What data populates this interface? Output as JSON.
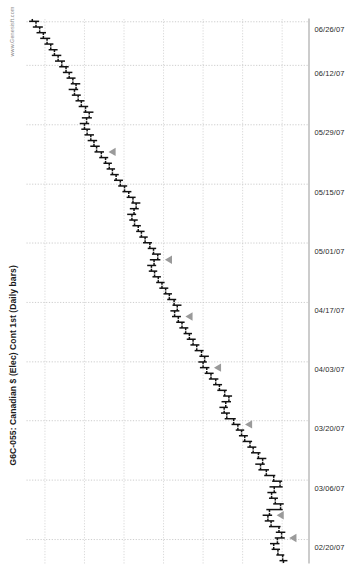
{
  "chart": {
    "title": "G6C-055: Canadian $ (Elec) Cont 1st (Daily bars)",
    "watermark": "www.Genesisft.com"
  },
  "chart_data": {
    "type": "ohlc",
    "title": "G6C-055: Canadian $ (Elec) Cont 1st (Daily bars)",
    "subtitle": "",
    "xlabel": "",
    "ylabel": "",
    "grid": true,
    "legend": false,
    "orientation": "rotated-90-ccw",
    "bar_style": "open-left-tick / close-right-tick OHLC daily bars",
    "bar_color": "#111111",
    "marker_color": "#9a9a9a",
    "marker_shape": "triangle",
    "marker_note": "gray triangle markers placed beside selected bars",
    "xlim": [
      "02/13/07",
      "06/29/07"
    ],
    "ylim": [
      0.845,
      0.952
    ],
    "ytick_step": 0.015,
    "xtick_labels": [
      "02/20/07",
      "03/06/07",
      "03/20/07",
      "04/03/07",
      "04/17/07",
      "05/01/07",
      "05/15/07",
      "05/29/07",
      "06/12/07",
      "06/26/07"
    ],
    "xtick_positions_pct": [
      4.4,
      15.3,
      26.2,
      37.0,
      47.9,
      58.8,
      69.6,
      80.5,
      91.4,
      99.4
    ],
    "ygridlines": [
      0.855,
      0.87,
      0.885,
      0.9,
      0.915,
      0.93,
      0.945
    ],
    "bars": [
      {
        "date": "02/13/07",
        "open": 0.8545,
        "high": 0.856,
        "low": 0.853,
        "close": 0.8548,
        "marker": false
      },
      {
        "date": "02/14/07",
        "open": 0.8548,
        "high": 0.8572,
        "low": 0.8542,
        "close": 0.8566,
        "marker": false
      },
      {
        "date": "02/15/07",
        "open": 0.8566,
        "high": 0.859,
        "low": 0.8558,
        "close": 0.8582,
        "marker": false
      },
      {
        "date": "02/16/07",
        "open": 0.8582,
        "high": 0.8596,
        "low": 0.856,
        "close": 0.8568,
        "marker": false
      },
      {
        "date": "02/20/07",
        "open": 0.8568,
        "high": 0.8578,
        "low": 0.854,
        "close": 0.8552,
        "marker": true
      },
      {
        "date": "02/21/07",
        "open": 0.8552,
        "high": 0.8574,
        "low": 0.8538,
        "close": 0.8562,
        "marker": false
      },
      {
        "date": "02/22/07",
        "open": 0.8562,
        "high": 0.86,
        "low": 0.8556,
        "close": 0.8592,
        "marker": false
      },
      {
        "date": "02/23/07",
        "open": 0.8592,
        "high": 0.8616,
        "low": 0.858,
        "close": 0.8604,
        "marker": false
      },
      {
        "date": "02/26/07",
        "open": 0.8604,
        "high": 0.8624,
        "low": 0.8588,
        "close": 0.8598,
        "marker": true
      },
      {
        "date": "02/27/07",
        "open": 0.8598,
        "high": 0.861,
        "low": 0.8548,
        "close": 0.8556,
        "marker": false
      },
      {
        "date": "02/28/07",
        "open": 0.8556,
        "high": 0.8584,
        "low": 0.8544,
        "close": 0.8576,
        "marker": false
      },
      {
        "date": "03/01/07",
        "open": 0.8576,
        "high": 0.86,
        "low": 0.8566,
        "close": 0.859,
        "marker": false
      },
      {
        "date": "03/02/07",
        "open": 0.859,
        "high": 0.8606,
        "low": 0.8572,
        "close": 0.858,
        "marker": false
      },
      {
        "date": "03/05/07",
        "open": 0.858,
        "high": 0.8598,
        "low": 0.8548,
        "close": 0.8558,
        "marker": false
      },
      {
        "date": "03/06/07",
        "open": 0.8558,
        "high": 0.8588,
        "low": 0.855,
        "close": 0.8582,
        "marker": false
      },
      {
        "date": "03/07/07",
        "open": 0.8582,
        "high": 0.8618,
        "low": 0.8576,
        "close": 0.861,
        "marker": false
      },
      {
        "date": "03/08/07",
        "open": 0.861,
        "high": 0.864,
        "low": 0.86,
        "close": 0.8632,
        "marker": false
      },
      {
        "date": "03/09/07",
        "open": 0.8632,
        "high": 0.8652,
        "low": 0.8616,
        "close": 0.8624,
        "marker": false
      },
      {
        "date": "03/12/07",
        "open": 0.8624,
        "high": 0.8646,
        "low": 0.861,
        "close": 0.864,
        "marker": false
      },
      {
        "date": "03/13/07",
        "open": 0.864,
        "high": 0.8668,
        "low": 0.8632,
        "close": 0.866,
        "marker": false
      },
      {
        "date": "03/14/07",
        "open": 0.866,
        "high": 0.8682,
        "low": 0.8648,
        "close": 0.8672,
        "marker": false
      },
      {
        "date": "03/15/07",
        "open": 0.8672,
        "high": 0.87,
        "low": 0.8664,
        "close": 0.8692,
        "marker": false
      },
      {
        "date": "03/16/07",
        "open": 0.8692,
        "high": 0.8714,
        "low": 0.868,
        "close": 0.8704,
        "marker": false
      },
      {
        "date": "03/19/07",
        "open": 0.8704,
        "high": 0.8726,
        "low": 0.8694,
        "close": 0.8718,
        "marker": false
      },
      {
        "date": "03/20/07",
        "open": 0.8718,
        "high": 0.8742,
        "low": 0.8708,
        "close": 0.8734,
        "marker": true
      },
      {
        "date": "03/21/07",
        "open": 0.8734,
        "high": 0.8768,
        "low": 0.8726,
        "close": 0.876,
        "marker": false
      },
      {
        "date": "03/22/07",
        "open": 0.876,
        "high": 0.8782,
        "low": 0.8748,
        "close": 0.877,
        "marker": false
      },
      {
        "date": "03/23/07",
        "open": 0.877,
        "high": 0.8788,
        "low": 0.8756,
        "close": 0.8764,
        "marker": false
      },
      {
        "date": "03/26/07",
        "open": 0.8764,
        "high": 0.878,
        "low": 0.8744,
        "close": 0.8752,
        "marker": false
      },
      {
        "date": "03/27/07",
        "open": 0.8752,
        "high": 0.8774,
        "low": 0.874,
        "close": 0.8768,
        "marker": false
      },
      {
        "date": "03/28/07",
        "open": 0.8768,
        "high": 0.8796,
        "low": 0.876,
        "close": 0.8788,
        "marker": false
      },
      {
        "date": "03/29/07",
        "open": 0.8788,
        "high": 0.8812,
        "low": 0.8778,
        "close": 0.8802,
        "marker": false
      },
      {
        "date": "03/30/07",
        "open": 0.8802,
        "high": 0.8828,
        "low": 0.8792,
        "close": 0.882,
        "marker": false
      },
      {
        "date": "04/02/07",
        "open": 0.882,
        "high": 0.8844,
        "low": 0.881,
        "close": 0.8836,
        "marker": false
      },
      {
        "date": "04/03/07",
        "open": 0.8836,
        "high": 0.8862,
        "low": 0.8826,
        "close": 0.885,
        "marker": true
      },
      {
        "date": "04/04/07",
        "open": 0.885,
        "high": 0.8868,
        "low": 0.8836,
        "close": 0.8844,
        "marker": false
      },
      {
        "date": "04/05/07",
        "open": 0.8844,
        "high": 0.8864,
        "low": 0.8828,
        "close": 0.8856,
        "marker": false
      },
      {
        "date": "04/09/07",
        "open": 0.8856,
        "high": 0.8882,
        "low": 0.8848,
        "close": 0.8874,
        "marker": false
      },
      {
        "date": "04/10/07",
        "open": 0.8874,
        "high": 0.8898,
        "low": 0.8864,
        "close": 0.8888,
        "marker": false
      },
      {
        "date": "04/11/07",
        "open": 0.8888,
        "high": 0.8912,
        "low": 0.8878,
        "close": 0.8902,
        "marker": false
      },
      {
        "date": "04/12/07",
        "open": 0.8902,
        "high": 0.8924,
        "low": 0.8892,
        "close": 0.8916,
        "marker": false
      },
      {
        "date": "04/13/07",
        "open": 0.8916,
        "high": 0.894,
        "low": 0.8906,
        "close": 0.893,
        "marker": false
      },
      {
        "date": "04/16/07",
        "open": 0.893,
        "high": 0.8952,
        "low": 0.892,
        "close": 0.8944,
        "marker": false
      },
      {
        "date": "04/17/07",
        "open": 0.8944,
        "high": 0.8968,
        "low": 0.8934,
        "close": 0.8958,
        "marker": true
      },
      {
        "date": "04/18/07",
        "open": 0.8958,
        "high": 0.8974,
        "low": 0.894,
        "close": 0.8948,
        "marker": false
      },
      {
        "date": "04/19/07",
        "open": 0.8948,
        "high": 0.8966,
        "low": 0.8932,
        "close": 0.896,
        "marker": false
      },
      {
        "date": "04/20/07",
        "open": 0.896,
        "high": 0.8986,
        "low": 0.8952,
        "close": 0.8978,
        "marker": false
      },
      {
        "date": "04/23/07",
        "open": 0.8978,
        "high": 0.9,
        "low": 0.8968,
        "close": 0.8992,
        "marker": false
      },
      {
        "date": "04/24/07",
        "open": 0.8992,
        "high": 0.9016,
        "low": 0.8982,
        "close": 0.9006,
        "marker": false
      },
      {
        "date": "04/25/07",
        "open": 0.9006,
        "high": 0.9028,
        "low": 0.8996,
        "close": 0.902,
        "marker": false
      },
      {
        "date": "04/26/07",
        "open": 0.902,
        "high": 0.9042,
        "low": 0.901,
        "close": 0.9034,
        "marker": false
      },
      {
        "date": "04/27/07",
        "open": 0.9034,
        "high": 0.9056,
        "low": 0.9024,
        "close": 0.9046,
        "marker": false
      },
      {
        "date": "04/30/07",
        "open": 0.9046,
        "high": 0.9062,
        "low": 0.9028,
        "close": 0.9036,
        "marker": false
      },
      {
        "date": "05/01/07",
        "open": 0.9036,
        "high": 0.9052,
        "low": 0.9012,
        "close": 0.9022,
        "marker": true
      },
      {
        "date": "05/02/07",
        "open": 0.9022,
        "high": 0.9044,
        "low": 0.901,
        "close": 0.9038,
        "marker": false
      },
      {
        "date": "05/03/07",
        "open": 0.9038,
        "high": 0.906,
        "low": 0.9028,
        "close": 0.9052,
        "marker": false
      },
      {
        "date": "05/04/07",
        "open": 0.9052,
        "high": 0.9078,
        "low": 0.9044,
        "close": 0.907,
        "marker": false
      },
      {
        "date": "05/07/07",
        "open": 0.907,
        "high": 0.9092,
        "low": 0.906,
        "close": 0.9084,
        "marker": false
      },
      {
        "date": "05/08/07",
        "open": 0.9084,
        "high": 0.9104,
        "low": 0.9072,
        "close": 0.9096,
        "marker": false
      },
      {
        "date": "05/09/07",
        "open": 0.9096,
        "high": 0.9118,
        "low": 0.9086,
        "close": 0.911,
        "marker": false
      },
      {
        "date": "05/10/07",
        "open": 0.911,
        "high": 0.913,
        "low": 0.9098,
        "close": 0.912,
        "marker": false
      },
      {
        "date": "05/11/07",
        "open": 0.912,
        "high": 0.9138,
        "low": 0.9104,
        "close": 0.9112,
        "marker": false
      },
      {
        "date": "05/14/07",
        "open": 0.9112,
        "high": 0.9128,
        "low": 0.9094,
        "close": 0.9104,
        "marker": false
      },
      {
        "date": "05/15/07",
        "open": 0.9104,
        "high": 0.9122,
        "low": 0.9088,
        "close": 0.9116,
        "marker": false
      },
      {
        "date": "05/16/07",
        "open": 0.9116,
        "high": 0.914,
        "low": 0.9106,
        "close": 0.9132,
        "marker": false
      },
      {
        "date": "05/17/07",
        "open": 0.9132,
        "high": 0.9156,
        "low": 0.9122,
        "close": 0.9148,
        "marker": false
      },
      {
        "date": "05/18/07",
        "open": 0.9148,
        "high": 0.9172,
        "low": 0.9138,
        "close": 0.9164,
        "marker": false
      },
      {
        "date": "05/21/07",
        "open": 0.9164,
        "high": 0.9188,
        "low": 0.9154,
        "close": 0.918,
        "marker": false
      },
      {
        "date": "05/22/07",
        "open": 0.918,
        "high": 0.9202,
        "low": 0.917,
        "close": 0.9194,
        "marker": false
      },
      {
        "date": "05/23/07",
        "open": 0.9194,
        "high": 0.9216,
        "low": 0.9184,
        "close": 0.9206,
        "marker": false
      },
      {
        "date": "05/24/07",
        "open": 0.9206,
        "high": 0.9228,
        "low": 0.9196,
        "close": 0.922,
        "marker": false
      },
      {
        "date": "05/25/07",
        "open": 0.922,
        "high": 0.9244,
        "low": 0.921,
        "close": 0.9236,
        "marker": false
      },
      {
        "date": "05/29/07",
        "open": 0.9236,
        "high": 0.9262,
        "low": 0.9226,
        "close": 0.9254,
        "marker": true
      },
      {
        "date": "05/30/07",
        "open": 0.9254,
        "high": 0.9278,
        "low": 0.9242,
        "close": 0.9264,
        "marker": false
      },
      {
        "date": "05/31/07",
        "open": 0.9264,
        "high": 0.9288,
        "low": 0.9252,
        "close": 0.9276,
        "marker": false
      },
      {
        "date": "06/01/07",
        "open": 0.9276,
        "high": 0.93,
        "low": 0.9264,
        "close": 0.929,
        "marker": false
      },
      {
        "date": "06/04/07",
        "open": 0.929,
        "high": 0.9312,
        "low": 0.9278,
        "close": 0.93,
        "marker": false
      },
      {
        "date": "06/05/07",
        "open": 0.93,
        "high": 0.9318,
        "low": 0.9282,
        "close": 0.9292,
        "marker": false
      },
      {
        "date": "06/06/07",
        "open": 0.9292,
        "high": 0.931,
        "low": 0.9272,
        "close": 0.9282,
        "marker": false
      },
      {
        "date": "06/07/07",
        "open": 0.9282,
        "high": 0.9304,
        "low": 0.9266,
        "close": 0.9296,
        "marker": false
      },
      {
        "date": "06/08/07",
        "open": 0.9296,
        "high": 0.9322,
        "low": 0.9286,
        "close": 0.9312,
        "marker": false
      },
      {
        "date": "06/11/07",
        "open": 0.9312,
        "high": 0.9334,
        "low": 0.93,
        "close": 0.9324,
        "marker": false
      },
      {
        "date": "06/12/07",
        "open": 0.9324,
        "high": 0.9348,
        "low": 0.9314,
        "close": 0.9338,
        "marker": false
      },
      {
        "date": "06/13/07",
        "open": 0.9338,
        "high": 0.936,
        "low": 0.9324,
        "close": 0.9332,
        "marker": false
      },
      {
        "date": "06/14/07",
        "open": 0.9332,
        "high": 0.9352,
        "low": 0.9316,
        "close": 0.9344,
        "marker": false
      },
      {
        "date": "06/15/07",
        "open": 0.9344,
        "high": 0.9368,
        "low": 0.9334,
        "close": 0.9358,
        "marker": false
      },
      {
        "date": "06/18/07",
        "open": 0.9358,
        "high": 0.9382,
        "low": 0.9346,
        "close": 0.937,
        "marker": false
      },
      {
        "date": "06/19/07",
        "open": 0.937,
        "high": 0.9396,
        "low": 0.936,
        "close": 0.9386,
        "marker": false
      },
      {
        "date": "06/20/07",
        "open": 0.9386,
        "high": 0.9412,
        "low": 0.9374,
        "close": 0.94,
        "marker": false
      },
      {
        "date": "06/21/07",
        "open": 0.94,
        "high": 0.9424,
        "low": 0.9388,
        "close": 0.9414,
        "marker": false
      },
      {
        "date": "06/22/07",
        "open": 0.9414,
        "high": 0.9436,
        "low": 0.9402,
        "close": 0.9428,
        "marker": false
      },
      {
        "date": "06/25/07",
        "open": 0.9428,
        "high": 0.9452,
        "low": 0.9418,
        "close": 0.9442,
        "marker": false
      },
      {
        "date": "06/26/07",
        "open": 0.9442,
        "high": 0.9468,
        "low": 0.943,
        "close": 0.9456,
        "marker": false
      },
      {
        "date": "06/27/07",
        "open": 0.9456,
        "high": 0.9482,
        "low": 0.9446,
        "close": 0.947,
        "marker": false
      },
      {
        "date": "06/28/07",
        "open": 0.947,
        "high": 0.9496,
        "low": 0.9458,
        "close": 0.9484,
        "marker": false
      },
      {
        "date": "06/29/07",
        "open": 0.9484,
        "high": 0.951,
        "low": 0.9472,
        "close": 0.9498,
        "marker": false
      }
    ]
  }
}
